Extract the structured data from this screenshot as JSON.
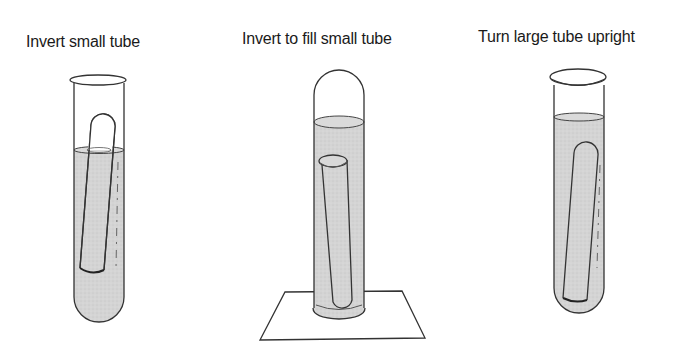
{
  "steps": [
    {
      "label": "Invert small tube"
    },
    {
      "label": "Invert to fill small tube"
    },
    {
      "label": "Turn large tube upright"
    }
  ],
  "colors": {
    "liquid": "#d2d2d2",
    "outline": "#333333",
    "background": "#ffffff"
  }
}
